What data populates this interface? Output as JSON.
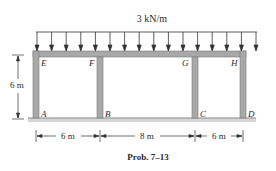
{
  "load": {
    "label": "3 kN/m",
    "arrow_count": 16
  },
  "joints": {
    "E": "E",
    "F": "F",
    "G": "G",
    "H": "H",
    "A": "A",
    "B": "B",
    "C": "C",
    "D": "D"
  },
  "dimensions": {
    "height": "6 m",
    "spans": [
      "6 m",
      "8 m",
      "6 m"
    ]
  },
  "caption": "Prob. 7–13",
  "colors": {
    "member_fill": "#a8a8a8",
    "member_edge": "#7a7a7a",
    "ground": "#cfcfcf",
    "line": "#333333",
    "text": "#2a2a2a"
  }
}
